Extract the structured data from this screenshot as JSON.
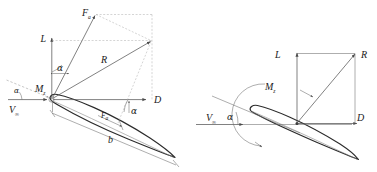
{
  "figure": {
    "background_color": "#ffffff",
    "line_color": "#4a4a4a",
    "airfoil_color": "#2b2b2b",
    "dashed_color": "#9a9a9a",
    "panels": [
      {
        "id": "left-panel",
        "name": "force-parallelogram-diagram",
        "description": "Airfoil with resultant force R decomposed into lift L and drag D, plus force F and chord b",
        "labels": [
          {
            "key": "F",
            "text": "F",
            "sub": "a",
            "name": "force-f-label"
          },
          {
            "key": "L",
            "text": "L",
            "sub": "",
            "name": "lift-label"
          },
          {
            "key": "R",
            "text": "R",
            "sub": "",
            "name": "resultant-force-label"
          },
          {
            "key": "D",
            "text": "D",
            "sub": "",
            "name": "drag-label"
          },
          {
            "key": "Mz",
            "text": "M",
            "sub": "z",
            "name": "moment-label"
          },
          {
            "key": "Vinf",
            "text": "V",
            "sub": "∞",
            "name": "freestream-velocity-label"
          },
          {
            "key": "Fchord",
            "text": "F",
            "sub": "a",
            "name": "chord-force-label"
          },
          {
            "key": "b",
            "text": "b",
            "sub": "",
            "name": "chord-length-label"
          },
          {
            "key": "alpha1",
            "text": "α",
            "sub": "",
            "name": "angle-of-attack-label-lift"
          },
          {
            "key": "alpha2",
            "text": "α",
            "sub": "",
            "name": "angle-of-attack-label-drag"
          },
          {
            "key": "alpha3",
            "text": "α",
            "sub": "",
            "name": "angle-of-attack-label-leading"
          }
        ]
      },
      {
        "id": "right-panel",
        "name": "force-resultant-diagram",
        "description": "Airfoil at angle of attack with lift L, drag D, resultant R and pitching moment Mz",
        "labels": [
          {
            "key": "L",
            "text": "L",
            "sub": "",
            "name": "lift-label"
          },
          {
            "key": "R",
            "text": "R",
            "sub": "",
            "name": "resultant-force-label"
          },
          {
            "key": "D",
            "text": "D",
            "sub": "",
            "name": "drag-label"
          },
          {
            "key": "Mz",
            "text": "M",
            "sub": "z",
            "name": "moment-label"
          },
          {
            "key": "Vinf",
            "text": "V",
            "sub": "∞",
            "name": "freestream-velocity-label"
          },
          {
            "key": "alpha",
            "text": "α",
            "sub": "",
            "name": "angle-of-attack-label"
          }
        ]
      }
    ]
  }
}
